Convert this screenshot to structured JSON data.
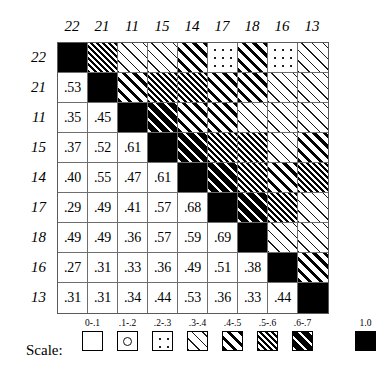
{
  "chart_data": {
    "type": "heatmap",
    "title": "",
    "xlabel": "",
    "ylabel": "",
    "categories": [
      "22",
      "21",
      "11",
      "15",
      "14",
      "17",
      "18",
      "16",
      "13"
    ],
    "row_labels": [
      "22",
      "21",
      "11",
      "15",
      "14",
      "17",
      "18",
      "16",
      "13"
    ],
    "column_labels": [
      "22",
      "21",
      "11",
      "15",
      "14",
      "17",
      "18",
      "16",
      "13"
    ],
    "matrix": [
      [
        1.0,
        0.53,
        0.35,
        0.37,
        0.4,
        0.29,
        0.49,
        0.27,
        0.31
      ],
      [
        0.53,
        1.0,
        0.45,
        0.52,
        0.55,
        0.49,
        0.49,
        0.31,
        0.31
      ],
      [
        0.35,
        0.45,
        1.0,
        0.61,
        0.47,
        0.41,
        0.36,
        0.33,
        0.34
      ],
      [
        0.37,
        0.52,
        0.61,
        1.0,
        0.61,
        0.57,
        0.57,
        0.36,
        0.44
      ],
      [
        0.4,
        0.55,
        0.47,
        0.61,
        1.0,
        0.68,
        0.59,
        0.49,
        0.53
      ],
      [
        0.29,
        0.49,
        0.41,
        0.57,
        0.68,
        1.0,
        0.69,
        0.51,
        0.36
      ],
      [
        0.49,
        0.49,
        0.36,
        0.57,
        0.59,
        0.69,
        1.0,
        0.38,
        0.33
      ],
      [
        0.27,
        0.31,
        0.33,
        0.36,
        0.49,
        0.51,
        0.38,
        1.0,
        0.44
      ],
      [
        0.31,
        0.31,
        0.34,
        0.44,
        0.53,
        0.36,
        0.33,
        0.44,
        1.0
      ]
    ],
    "cell_text": [
      [
        "",
        "",
        "",
        "",
        "",
        "",
        "",
        "",
        ""
      ],
      [
        ".53",
        "",
        "",
        "",
        "",
        "",
        "",
        "",
        ""
      ],
      [
        ".35",
        ".45",
        "",
        "",
        "",
        "",
        "",
        "",
        ""
      ],
      [
        ".37",
        ".52",
        ".61",
        "",
        "",
        "",
        "",
        "",
        ""
      ],
      [
        ".40",
        ".55",
        ".47",
        ".61",
        "",
        "",
        "",
        "",
        ""
      ],
      [
        ".29",
        ".49",
        ".41",
        ".57",
        ".68",
        "",
        "",
        "",
        ""
      ],
      [
        ".49",
        ".49",
        ".36",
        ".57",
        ".59",
        ".69",
        "",
        "",
        ""
      ],
      [
        ".27",
        ".31",
        ".33",
        ".36",
        ".49",
        ".51",
        ".38",
        "",
        ""
      ],
      [
        ".31",
        ".31",
        ".34",
        ".44",
        ".53",
        ".36",
        ".33",
        ".44",
        ""
      ]
    ],
    "legend_position": "bottom",
    "grid": true
  },
  "legend": {
    "title": "Scale:",
    "items": [
      {
        "label": "0-.1",
        "pattern": "blank",
        "range": [
          0.0,
          0.1
        ]
      },
      {
        "label": ".1-.2",
        "pattern": "single-ring",
        "range": [
          0.1,
          0.2
        ]
      },
      {
        "label": ".2-.3",
        "pattern": "sparse-dots",
        "range": [
          0.2,
          0.3
        ]
      },
      {
        "label": ".3-.4",
        "pattern": "thin-diagonal",
        "range": [
          0.3,
          0.4
        ]
      },
      {
        "label": ".4-.5",
        "pattern": "medium-diagonal",
        "range": [
          0.4,
          0.5
        ]
      },
      {
        "label": ".5-.6",
        "pattern": "dense-diagonal",
        "range": [
          0.5,
          0.6
        ]
      },
      {
        "label": ".6-.7",
        "pattern": "dark-diagonal",
        "range": [
          0.6,
          0.7
        ]
      },
      {
        "label": "1.0",
        "pattern": "solid-black",
        "range": [
          1.0,
          1.0
        ]
      }
    ]
  }
}
